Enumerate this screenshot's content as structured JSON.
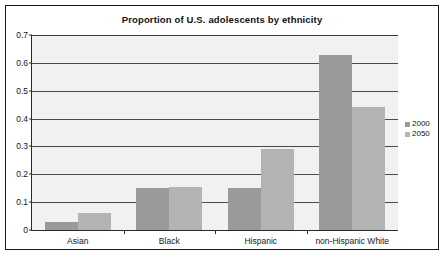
{
  "chart_data": {
    "type": "bar",
    "title": "Proportion of U.S. adolescents by ethnicity",
    "xlabel": "",
    "ylabel": "",
    "categories": [
      "Asian",
      "Black",
      "Hispanic",
      "non-Hispanic White"
    ],
    "series": [
      {
        "name": "2000",
        "color": "#999a99",
        "values": [
          0.03,
          0.15,
          0.15,
          0.63
        ]
      },
      {
        "name": "2050",
        "color": "#b2b3b2",
        "values": [
          0.06,
          0.155,
          0.29,
          0.44
        ]
      }
    ],
    "ylim": [
      0,
      0.7
    ],
    "ytick_labels": [
      "0",
      "0.1",
      "0.2",
      "0.3",
      "0.4",
      "0.5",
      "0.6",
      "0.7"
    ],
    "ytick_values": [
      0,
      0.1,
      0.2,
      0.3,
      0.4,
      0.5,
      0.6,
      0.7
    ],
    "grid": true,
    "legend_position": "right",
    "plot_background": "#f1f1f1",
    "frame_color": "#1a1a1a"
  },
  "legend": {
    "entries": [
      {
        "label": "2000"
      },
      {
        "label": "2050"
      }
    ]
  }
}
